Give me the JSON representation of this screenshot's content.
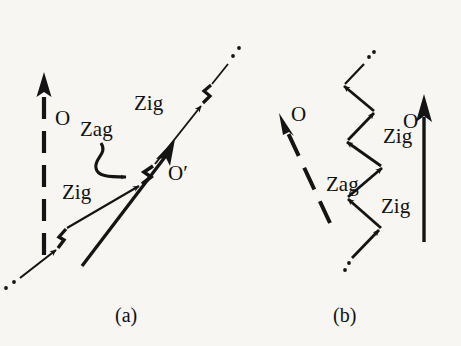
{
  "figure": {
    "title": "",
    "background_color": "#f7f6f3",
    "ink_color": "#141414",
    "width": 461,
    "height": 346,
    "panels": [
      {
        "id": "a",
        "caption": "(a)",
        "description": "Zigzag path shown as an almost-straight diagonal line with small kinks; observer O axis is vertical dashed, observer O-prime axis is a diagonal solid arrow parallel to the zigzag.",
        "labels": {
          "axis_o": "O",
          "axis_o_prime": "O′",
          "zig_lower": "Zig",
          "zig_upper": "Zig",
          "zag": "Zag"
        },
        "axes": [
          {
            "name": "O",
            "style": "dashed",
            "direction": "up"
          },
          {
            "name": "O′",
            "style": "solid",
            "direction": "up-right"
          }
        ],
        "segments": [
          "Zig",
          "Zag",
          "Zig"
        ]
      },
      {
        "id": "b",
        "caption": "(b)",
        "description": "Same worldline seen in the other frame: a wide zigzag; observer O axis is a dashed arrow pointing up-left, observer O-prime axis is a solid vertical arrow.",
        "labels": {
          "axis_o": "O",
          "axis_o_prime": "O′",
          "zig_lower": "Zig",
          "zig_upper": "Zig",
          "zag": "Zag"
        },
        "axes": [
          {
            "name": "O",
            "style": "dashed",
            "direction": "up-left"
          },
          {
            "name": "O′",
            "style": "solid",
            "direction": "up"
          }
        ],
        "segments": [
          "Zig",
          "Zag",
          "Zig"
        ]
      }
    ]
  }
}
